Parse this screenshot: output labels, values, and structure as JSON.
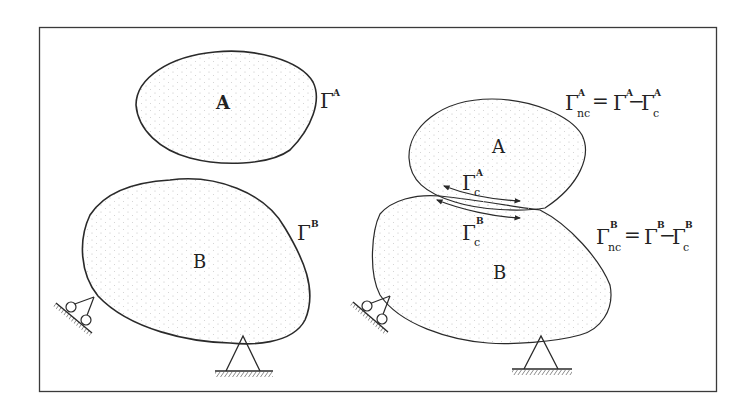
{
  "colors": {
    "background": "#ffffff",
    "stroke": "#2a2a2a",
    "frame": "#3a3a3a",
    "stipple": "#b8b8b8"
  },
  "left_panel": {
    "body_a_label": "A",
    "body_b_label": "B",
    "gamma_a": {
      "symbol": "Γ",
      "sup": "A"
    },
    "gamma_b": {
      "symbol": "Γ",
      "sup": "B"
    }
  },
  "right_panel": {
    "body_a_label": "A",
    "body_b_label": "B",
    "gamma_c_a": {
      "symbol": "Γ",
      "sup": "A",
      "sub": "c"
    },
    "gamma_c_b": {
      "symbol": "Γ",
      "sup": "B",
      "sub": "c"
    },
    "eq_a": {
      "lhs": {
        "symbol": "Γ",
        "sup": "A",
        "sub": "nc"
      },
      "eq": "=",
      "t1": {
        "symbol": "Γ",
        "sup": "A"
      },
      "minus": "−",
      "t2": {
        "symbol": "Γ",
        "sup": "A",
        "sub": "c"
      }
    },
    "eq_b": {
      "lhs": {
        "symbol": "Γ",
        "sup": "B",
        "sub": "nc"
      },
      "eq": "=",
      "t1": {
        "symbol": "Γ",
        "sup": "B"
      },
      "minus": "−",
      "t2": {
        "symbol": "Γ",
        "sup": "B",
        "sub": "c"
      }
    }
  }
}
